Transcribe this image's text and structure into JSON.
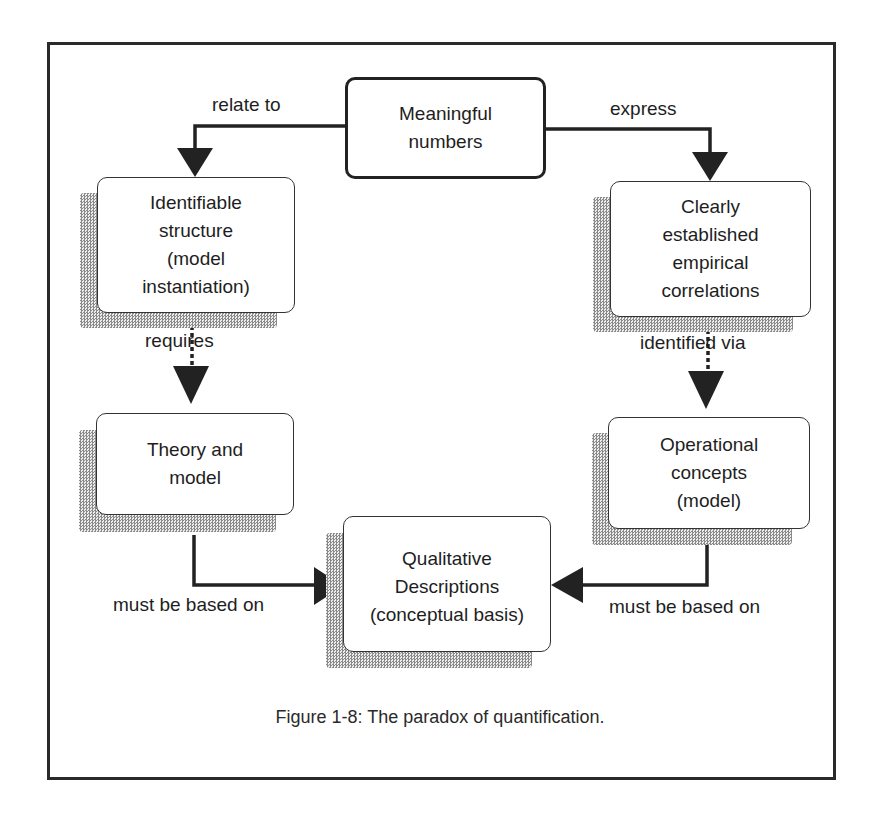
{
  "diagram": {
    "nodes": {
      "meaningful": {
        "text": "Meaningful\nnumbers"
      },
      "identifiable": {
        "text": "Identifiable\nstructure\n(model\ninstantiation)"
      },
      "clearly": {
        "text": "Clearly\nestablished\nempirical\ncorrelations"
      },
      "theory": {
        "text": "Theory and\nmodel"
      },
      "operational": {
        "text": "Operational\nconcepts\n(model)"
      },
      "qualitative": {
        "text": "Qualitative\nDescriptions\n(conceptual basis)"
      }
    },
    "edges": {
      "relate_to": "relate to",
      "express": "express",
      "requires": "requires",
      "identified_via": "identified via",
      "based_on_left": "must be based on",
      "based_on_right": "must be based on"
    }
  },
  "caption": "Figure 1-8: The paradox of quantification."
}
